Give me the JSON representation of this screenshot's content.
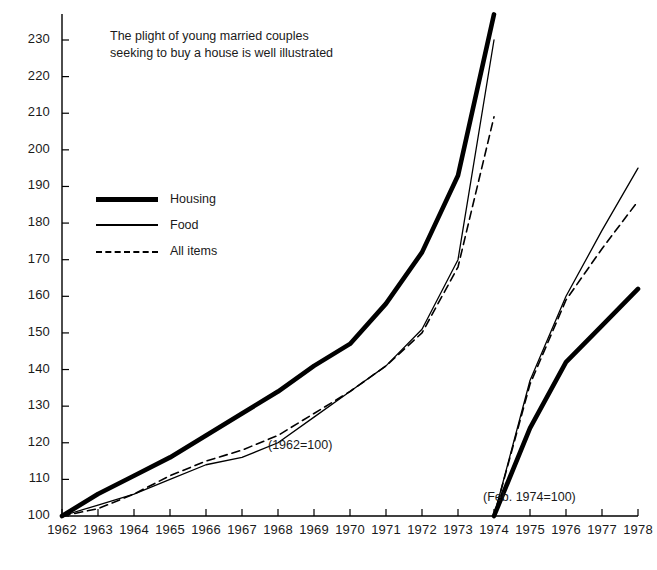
{
  "note": {
    "text": "The plight of young married couples seeking to buy a house is well illustrated"
  },
  "legend": {
    "position": "inside-top-left",
    "items": [
      {
        "label": "Housing",
        "style": "thick-solid"
      },
      {
        "label": "Food",
        "style": "thin-solid"
      },
      {
        "label": "All items",
        "style": "dashed"
      }
    ]
  },
  "annotations": [
    {
      "id": "base-1962",
      "text": "(1962=100)"
    },
    {
      "id": "base-1974",
      "text": "(Feb. 1974=100)"
    }
  ],
  "axes": {
    "y_ticks": [
      100,
      110,
      120,
      130,
      140,
      150,
      160,
      170,
      180,
      190,
      200,
      210,
      220,
      230
    ],
    "y_min": 100,
    "y_max": 237,
    "x_ticks": [
      1962,
      1963,
      1964,
      1965,
      1966,
      1967,
      1968,
      1969,
      1970,
      1971,
      1972,
      1973,
      1974,
      1975,
      1976,
      1977,
      1978
    ],
    "x_min": 1962,
    "x_max": 1978,
    "grid": false
  },
  "colors": {
    "ink": "#000000",
    "background": "#ffffff"
  },
  "chart_data": {
    "type": "line",
    "title": "",
    "subtitle": "The plight of young married couples seeking to buy a house is well illustrated",
    "xlabel": "",
    "ylabel": "",
    "xlim": [
      1962,
      1978
    ],
    "ylim": [
      100,
      237
    ],
    "grid": false,
    "legend_position": "inside-top-left",
    "panels": [
      {
        "name": "1962 base",
        "base_label": "(1962=100)",
        "x": [
          1962,
          1963,
          1964,
          1965,
          1966,
          1967,
          1968,
          1969,
          1970,
          1971,
          1972,
          1973,
          1974
        ],
        "series": [
          {
            "name": "Housing",
            "style": "thick-solid",
            "values": [
              100,
              106,
              111,
              116,
              122,
              128,
              134,
              141,
              147,
              158,
              172,
              193,
              237
            ]
          },
          {
            "name": "Food",
            "style": "thin-solid",
            "values": [
              100,
              103,
              106,
              110,
              114,
              116,
              120,
              127,
              134,
              141,
              151,
              170,
              230
            ]
          },
          {
            "name": "All items",
            "style": "dashed",
            "values": [
              100,
              102,
              106,
              111,
              115,
              118,
              122,
              128,
              134,
              141,
              150,
              168,
              209
            ]
          }
        ]
      },
      {
        "name": "Feb. 1974 base",
        "base_label": "(Feb. 1974=100)",
        "x": [
          1974,
          1975,
          1976,
          1977,
          1978
        ],
        "series": [
          {
            "name": "Housing",
            "style": "thick-solid",
            "values": [
              100,
              124,
              142,
              152,
              162
            ]
          },
          {
            "name": "Food",
            "style": "thin-solid",
            "values": [
              100,
              137,
              160,
              178,
              195
            ]
          },
          {
            "name": "All items",
            "style": "dashed",
            "values": [
              100,
              136,
              159,
              173,
              186
            ]
          }
        ]
      }
    ]
  }
}
